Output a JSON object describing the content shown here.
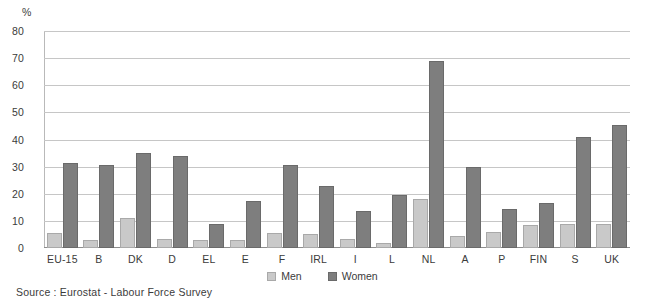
{
  "chart_data": {
    "type": "bar",
    "title": "",
    "subtitle": "",
    "xlabel": "",
    "ylabel": "%",
    "ylim": [
      0,
      80
    ],
    "yticks": [
      0,
      10,
      20,
      30,
      40,
      50,
      60,
      70,
      80
    ],
    "grid": true,
    "legend_position": "bottom-center",
    "categories": [
      "EU-15",
      "B",
      "DK",
      "D",
      "EL",
      "E",
      "F",
      "IRL",
      "I",
      "L",
      "NL",
      "A",
      "P",
      "FIN",
      "S",
      "UK"
    ],
    "series": [
      {
        "name": "Men",
        "color": "#c9c9c9",
        "values": [
          5.5,
          3,
          11,
          3.5,
          3,
          3,
          5.5,
          5,
          3.5,
          2,
          18,
          4.5,
          6,
          8.5,
          9,
          9
        ]
      },
      {
        "name": "Women",
        "color": "#7e7e7e",
        "values": [
          31.5,
          30.5,
          35,
          34,
          9,
          17.5,
          30.5,
          23,
          13.5,
          19.5,
          69,
          30,
          14.5,
          16.5,
          41,
          45.5
        ]
      }
    ],
    "annotations": {
      "source": "Source : Eurostat - Labour Force Survey"
    }
  },
  "axis": {
    "unit_label": "%",
    "tick_labels": [
      "80",
      "70",
      "60",
      "50",
      "40",
      "30",
      "20",
      "10",
      "0"
    ]
  },
  "legend": {
    "items": [
      {
        "label": "Men",
        "swatch": "men-swatch"
      },
      {
        "label": "Women",
        "swatch": "women-swatch"
      }
    ]
  },
  "footer": {
    "source_text": "Source : Eurostat - Labour Force Survey"
  },
  "colors": {
    "men": "#c9c9c9",
    "women": "#7e7e7e",
    "grid": "#c6c6c6",
    "text": "#3b3b3b",
    "background": "#ffffff"
  }
}
